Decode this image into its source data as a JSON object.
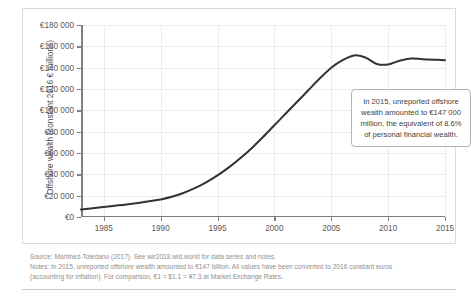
{
  "chart_data": {
    "type": "line",
    "title": "",
    "xlabel": "",
    "ylabel": "Offshore wealth (constant 2016 € millions)",
    "xlim": [
      1983,
      2015
    ],
    "ylim": [
      0,
      180000
    ],
    "grid": true,
    "legend": "none",
    "y_ticks": [
      0,
      20000,
      40000,
      60000,
      80000,
      100000,
      120000,
      140000,
      160000,
      180000
    ],
    "y_tick_labels": [
      "€0",
      "€20 000",
      "€40 000",
      "€60 000",
      "€80 000",
      "€100 000",
      "€120 000",
      "€140 000",
      "€160 000",
      "€180 000"
    ],
    "x_ticks": [
      1985,
      1990,
      1995,
      2000,
      2005,
      2010,
      2015
    ],
    "x_tick_labels": [
      "1985",
      "1990",
      "1995",
      "2000",
      "2005",
      "2010",
      "2015"
    ],
    "series": [
      {
        "name": "Offshore wealth",
        "color": "#333333",
        "x": [
          1983,
          1984,
          1985,
          1986,
          1987,
          1988,
          1989,
          1990,
          1991,
          1992,
          1993,
          1994,
          1995,
          1996,
          1997,
          1998,
          1999,
          2000,
          2001,
          2002,
          2003,
          2004,
          2005,
          2006,
          2007,
          2008,
          2009,
          2010,
          2011,
          2012,
          2013,
          2014,
          2015
        ],
        "values": [
          7000,
          8200,
          9400,
          10600,
          11800,
          13200,
          14800,
          16500,
          19000,
          22500,
          27000,
          32500,
          39000,
          46500,
          55000,
          64500,
          75000,
          86000,
          97000,
          108000,
          119000,
          130000,
          140000,
          147000,
          151500,
          149500,
          143500,
          143000,
          146500,
          148500,
          148000,
          147500,
          147000
        ]
      }
    ],
    "annotation": {
      "text": "In 2015, unreported offshore wealth amounted to €147 000 million, the equivalent of 8.6% of personal financial wealth."
    }
  },
  "notes": {
    "source": "Source: Martínez-Toledano (2017). See wir2018.wid.world for data series and notes.",
    "line1": "Notes: In 2015, unreported offshore wealth amounted to €147 billion. All values have been converted to 2016 constant euros",
    "line2": "(accounting for inflation). For comparison, €1 = $1.1 = ¥7.3 at Market Exchange Rates."
  }
}
